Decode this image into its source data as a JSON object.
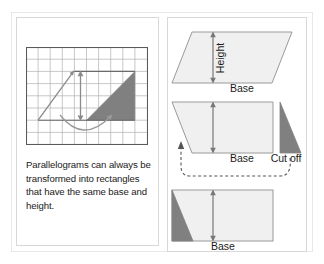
{
  "figure": {
    "colors": {
      "shaded_triangle": "#808080",
      "shape_fill": "#f0f0f0",
      "shape_stroke": "#999999",
      "grid_line": "#aaaaaa",
      "grid_border": "#666666",
      "arrow": "#777777",
      "text": "#1a1a1a",
      "panel_border": "#d8d8d8",
      "outer_border": "#e8e8e8",
      "background": "#ffffff"
    }
  },
  "left_panel": {
    "name": "grid-panel",
    "grid": {
      "columns": 10,
      "rows": 8,
      "triangle_label": "shaded-right-triangle",
      "height_arrow_label": "double-headed-height-arrow",
      "slant_arrow_label": "slanted-side-arrow",
      "curved_arrow_label": "curved-transform-arrow"
    },
    "caption": "Parallelograms can always be transformed into rectangles that have the same base and height."
  },
  "right_panel": {
    "name": "transformation-steps-panel",
    "steps": [
      {
        "id": "step-1-parallelogram",
        "shape": "parallelogram",
        "height_label": "Height",
        "base_label": "Base"
      },
      {
        "id": "step-2-cut-off",
        "shape": "parallelogram-with-cut",
        "base_label": "Base",
        "cut_label": "Cut off",
        "move_arrow_label": "dashed-move-arrow"
      },
      {
        "id": "step-3-rectangle",
        "shape": "rectangle-with-triangle",
        "base_label": "Base"
      }
    ]
  }
}
